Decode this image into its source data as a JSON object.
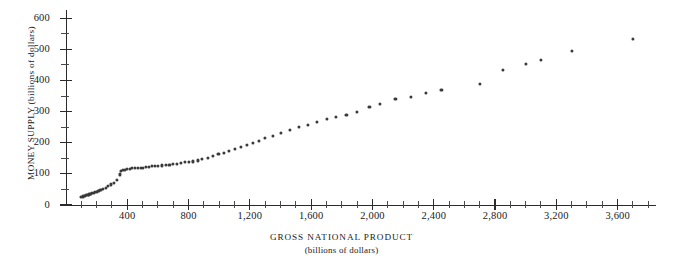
{
  "chart_data": {
    "type": "scatter",
    "title": "",
    "xlabel": "GROSS NATIONAL PRODUCT",
    "xlabel_sub": "(billions of dollars)",
    "ylabel": "MONEY SUPPLY (billions of dollars)",
    "xlim": [
      0,
      3850
    ],
    "ylim": [
      0,
      620
    ],
    "grid": false,
    "legend": null,
    "marker_color": "#3a3a3a",
    "axis_color": "#2b2b2b",
    "x_major_ticks": [
      400,
      800,
      1200,
      1600,
      2000,
      2400,
      2800,
      3200,
      3600
    ],
    "x_major_tick_labels": [
      "400",
      "800",
      "1,200",
      "1,600",
      "2,000",
      "2,400",
      "2,800",
      "3,200",
      "3,600"
    ],
    "x_minor_tick_step": 100,
    "y_major_ticks": [
      0,
      100,
      200,
      300,
      400,
      500,
      600
    ],
    "y_major_tick_labels": [
      "0",
      "100",
      "200",
      "300",
      "400",
      "500",
      "600"
    ],
    "y_minor_ticks": [
      50,
      150,
      250,
      350,
      450,
      550
    ],
    "points": [
      [
        100,
        25
      ],
      [
        108,
        27
      ],
      [
        112,
        29
      ],
      [
        118,
        28
      ],
      [
        125,
        30
      ],
      [
        132,
        31
      ],
      [
        140,
        33
      ],
      [
        148,
        34
      ],
      [
        156,
        35
      ],
      [
        165,
        36
      ],
      [
        172,
        38
      ],
      [
        180,
        39
      ],
      [
        190,
        41
      ],
      [
        200,
        43
      ],
      [
        212,
        45
      ],
      [
        225,
        48
      ],
      [
        240,
        52
      ],
      [
        258,
        56
      ],
      [
        275,
        60
      ],
      [
        292,
        66
      ],
      [
        310,
        72
      ],
      [
        330,
        80
      ],
      [
        350,
        98
      ],
      [
        360,
        108
      ],
      [
        372,
        112
      ],
      [
        385,
        114
      ],
      [
        400,
        116
      ],
      [
        416,
        117
      ],
      [
        432,
        118
      ],
      [
        450,
        119
      ],
      [
        470,
        120
      ],
      [
        488,
        118
      ],
      [
        505,
        119
      ],
      [
        524,
        121
      ],
      [
        543,
        122
      ],
      [
        562,
        124
      ],
      [
        580,
        126
      ],
      [
        600,
        125
      ],
      [
        625,
        127
      ],
      [
        650,
        129
      ],
      [
        675,
        130
      ],
      [
        700,
        131
      ],
      [
        724,
        133
      ],
      [
        750,
        135
      ],
      [
        775,
        137
      ],
      [
        800,
        138
      ],
      [
        830,
        140
      ],
      [
        860,
        143
      ],
      [
        890,
        147
      ],
      [
        925,
        152
      ],
      [
        960,
        157
      ],
      [
        995,
        163
      ],
      [
        1030,
        168
      ],
      [
        1065,
        174
      ],
      [
        1100,
        180
      ],
      [
        1140,
        186
      ],
      [
        1180,
        192
      ],
      [
        1220,
        198
      ],
      [
        1260,
        205
      ],
      [
        1300,
        214
      ],
      [
        1350,
        222
      ],
      [
        1400,
        232
      ],
      [
        1460,
        242
      ],
      [
        1520,
        250
      ],
      [
        1580,
        258
      ],
      [
        1640,
        266
      ],
      [
        1700,
        276
      ],
      [
        1760,
        284
      ],
      [
        1830,
        290
      ],
      [
        1900,
        300
      ],
      [
        1980,
        315
      ],
      [
        2050,
        325
      ],
      [
        2150,
        340
      ],
      [
        2250,
        348
      ],
      [
        2350,
        360
      ],
      [
        2450,
        370
      ],
      [
        2700,
        388
      ],
      [
        2850,
        435
      ],
      [
        3000,
        452
      ],
      [
        3100,
        466
      ],
      [
        3300,
        495
      ],
      [
        3700,
        533
      ]
    ]
  }
}
